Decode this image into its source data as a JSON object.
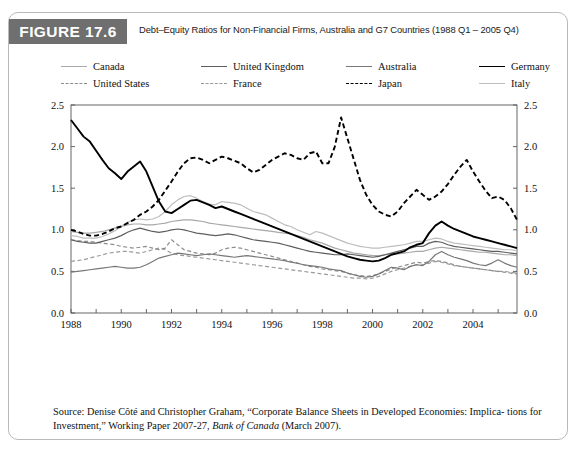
{
  "figure": {
    "badge": "FIGURE 17.6",
    "title": "Debt–Equity Ratios for Non-Financial Firms, Australia and G7 Countries (1988 Q1 – 2005 Q4)"
  },
  "source": {
    "line1_a": "Source: Denise Côté and Christopher Graham, “Corporate Balance Sheets in Developed Economies: Implica-",
    "line2_a": "tions for Investment,” Working Paper 2007-27, ",
    "line2_ital": "Bank of Canada",
    "line2_b": " (March 2007)."
  },
  "colors": {
    "canada": "#a8a8a8",
    "united_states": "#8d8d8d",
    "united_kingdom": "#5e5e5e",
    "france": "#9a9a9a",
    "australia": "#777777",
    "japan": "#000000",
    "germany": "#000000",
    "italy": "#bdbdbd",
    "axis": "#555555",
    "badge_bg": "#6f6f6f"
  },
  "chart_data": {
    "type": "line",
    "title": "Debt–Equity Ratios for Non-Financial Firms, Australia and G7 Countries (1988 Q1 – 2005 Q4)",
    "xlabel": "",
    "ylabel": "",
    "xlim": [
      1988,
      2005.75
    ],
    "ylim": [
      0.0,
      2.5
    ],
    "grid": false,
    "legend_position": "top",
    "y_ticks": [
      "0.0",
      "0.5",
      "1.0",
      "1.5",
      "2.0",
      "2.5"
    ],
    "y_tick_values": [
      0.0,
      0.5,
      1.0,
      1.5,
      2.0,
      2.5
    ],
    "y_axis_right_ticks": [
      "0.0",
      "0.5",
      "1.0",
      "1.5",
      "2.0",
      "2.5"
    ],
    "x_ticks": [
      "1988",
      "1990",
      "1992",
      "1994",
      "1996",
      "1998",
      "2000",
      "2002",
      "2004"
    ],
    "x_tick_values": [
      1988,
      1990,
      1992,
      1994,
      1996,
      1998,
      2000,
      2002,
      2004
    ],
    "x": [
      1988.0,
      1988.25,
      1988.5,
      1988.75,
      1989.0,
      1989.25,
      1989.5,
      1989.75,
      1990.0,
      1990.25,
      1990.5,
      1990.75,
      1991.0,
      1991.25,
      1991.5,
      1991.75,
      1992.0,
      1992.25,
      1992.5,
      1992.75,
      1993.0,
      1993.25,
      1993.5,
      1993.75,
      1994.0,
      1994.25,
      1994.5,
      1994.75,
      1995.0,
      1995.25,
      1995.5,
      1995.75,
      1996.0,
      1996.25,
      1996.5,
      1996.75,
      1997.0,
      1997.25,
      1997.5,
      1997.75,
      1998.0,
      1998.25,
      1998.5,
      1998.75,
      1999.0,
      1999.25,
      1999.5,
      1999.75,
      2000.0,
      2000.25,
      2000.5,
      2000.75,
      2001.0,
      2001.25,
      2001.5,
      2001.75,
      2002.0,
      2002.25,
      2002.5,
      2002.75,
      2003.0,
      2003.25,
      2003.5,
      2003.75,
      2004.0,
      2004.25,
      2004.5,
      2004.75,
      2005.0,
      2005.25,
      2005.5,
      2005.75
    ],
    "series": [
      {
        "name": "Germany",
        "style": "solid",
        "width": 1.9,
        "color": "#000000",
        "values": [
          2.32,
          2.22,
          2.12,
          2.06,
          1.95,
          1.84,
          1.74,
          1.68,
          1.61,
          1.7,
          1.76,
          1.82,
          1.7,
          1.52,
          1.34,
          1.22,
          1.2,
          1.25,
          1.3,
          1.35,
          1.36,
          1.33,
          1.3,
          1.26,
          1.28,
          1.25,
          1.22,
          1.19,
          1.16,
          1.13,
          1.1,
          1.07,
          1.04,
          1.01,
          0.98,
          0.95,
          0.92,
          0.89,
          0.86,
          0.83,
          0.8,
          0.77,
          0.74,
          0.71,
          0.68,
          0.66,
          0.64,
          0.63,
          0.62,
          0.63,
          0.66,
          0.7,
          0.72,
          0.74,
          0.79,
          0.82,
          0.84,
          0.96,
          1.05,
          1.1,
          1.05,
          1.01,
          0.98,
          0.95,
          0.92,
          0.9,
          0.88,
          0.86,
          0.84,
          0.82,
          0.8,
          0.78
        ]
      },
      {
        "name": "Japan",
        "style": "dashed",
        "width": 1.9,
        "color": "#000000",
        "values": [
          1.0,
          0.98,
          0.95,
          0.93,
          0.93,
          0.95,
          0.98,
          1.02,
          1.04,
          1.08,
          1.12,
          1.18,
          1.22,
          1.28,
          1.36,
          1.47,
          1.58,
          1.7,
          1.8,
          1.86,
          1.87,
          1.84,
          1.8,
          1.84,
          1.88,
          1.86,
          1.83,
          1.8,
          1.74,
          1.69,
          1.72,
          1.78,
          1.84,
          1.88,
          1.92,
          1.9,
          1.86,
          1.84,
          1.92,
          1.94,
          1.8,
          1.8,
          2.0,
          2.35,
          2.1,
          1.85,
          1.6,
          1.42,
          1.3,
          1.22,
          1.18,
          1.16,
          1.22,
          1.32,
          1.4,
          1.48,
          1.42,
          1.36,
          1.4,
          1.46,
          1.55,
          1.66,
          1.76,
          1.84,
          1.7,
          1.58,
          1.47,
          1.38,
          1.4,
          1.36,
          1.26,
          1.12
        ]
      },
      {
        "name": "Italy",
        "style": "solid",
        "width": 1.2,
        "color": "#bdbdbd",
        "values": [
          0.93,
          0.92,
          0.9,
          0.9,
          0.9,
          0.92,
          0.95,
          0.99,
          1.04,
          1.09,
          1.12,
          1.13,
          1.12,
          1.13,
          1.16,
          1.22,
          1.3,
          1.36,
          1.4,
          1.41,
          1.38,
          1.34,
          1.31,
          1.3,
          1.34,
          1.33,
          1.32,
          1.3,
          1.26,
          1.22,
          1.2,
          1.18,
          1.14,
          1.1,
          1.06,
          1.04,
          1.0,
          0.97,
          0.94,
          0.98,
          0.96,
          0.93,
          0.9,
          0.87,
          0.84,
          0.82,
          0.8,
          0.79,
          0.78,
          0.78,
          0.79,
          0.8,
          0.81,
          0.82,
          0.84,
          0.86,
          0.86,
          0.88,
          0.9,
          0.89,
          0.86,
          0.84,
          0.83,
          0.82,
          0.81,
          0.8,
          0.79,
          0.78,
          0.77,
          0.76,
          0.76,
          0.75
        ]
      },
      {
        "name": "Canada",
        "style": "solid",
        "width": 1.2,
        "color": "#a8a8a8",
        "values": [
          0.98,
          0.97,
          0.96,
          0.96,
          0.97,
          0.98,
          1.0,
          1.02,
          1.04,
          1.06,
          1.07,
          1.07,
          1.06,
          1.06,
          1.07,
          1.08,
          1.1,
          1.11,
          1.12,
          1.12,
          1.11,
          1.1,
          1.08,
          1.07,
          1.06,
          1.05,
          1.04,
          1.03,
          1.02,
          1.01,
          1.0,
          0.99,
          0.98,
          0.97,
          0.96,
          0.95,
          0.93,
          0.91,
          0.88,
          0.86,
          0.84,
          0.81,
          0.78,
          0.76,
          0.74,
          0.72,
          0.71,
          0.7,
          0.69,
          0.69,
          0.7,
          0.71,
          0.71,
          0.72,
          0.73,
          0.74,
          0.74,
          0.76,
          0.78,
          0.79,
          0.78,
          0.77,
          0.76,
          0.75,
          0.74,
          0.73,
          0.73,
          0.72,
          0.71,
          0.7,
          0.7,
          0.69
        ]
      },
      {
        "name": "United Kingdom",
        "style": "solid",
        "width": 1.2,
        "color": "#5e5e5e",
        "values": [
          0.88,
          0.86,
          0.85,
          0.84,
          0.84,
          0.86,
          0.88,
          0.9,
          0.93,
          0.97,
          1.0,
          1.02,
          1.0,
          0.98,
          0.97,
          0.98,
          1.0,
          1.01,
          1.0,
          0.98,
          0.96,
          0.95,
          0.94,
          0.93,
          0.94,
          0.95,
          0.94,
          0.92,
          0.9,
          0.88,
          0.87,
          0.86,
          0.85,
          0.84,
          0.82,
          0.8,
          0.78,
          0.76,
          0.74,
          0.73,
          0.72,
          0.71,
          0.7,
          0.7,
          0.71,
          0.7,
          0.69,
          0.68,
          0.67,
          0.68,
          0.7,
          0.72,
          0.74,
          0.76,
          0.78,
          0.8,
          0.8,
          0.84,
          0.86,
          0.85,
          0.82,
          0.8,
          0.79,
          0.78,
          0.77,
          0.76,
          0.75,
          0.74,
          0.74,
          0.73,
          0.72,
          0.71
        ]
      },
      {
        "name": "Australia",
        "style": "solid",
        "width": 1.2,
        "color": "#777777",
        "values": [
          0.49,
          0.5,
          0.51,
          0.52,
          0.53,
          0.54,
          0.55,
          0.56,
          0.55,
          0.54,
          0.54,
          0.55,
          0.58,
          0.62,
          0.66,
          0.68,
          0.7,
          0.72,
          0.71,
          0.7,
          0.69,
          0.7,
          0.71,
          0.7,
          0.69,
          0.68,
          0.67,
          0.68,
          0.69,
          0.68,
          0.67,
          0.66,
          0.65,
          0.64,
          0.63,
          0.61,
          0.6,
          0.58,
          0.57,
          0.56,
          0.55,
          0.53,
          0.52,
          0.51,
          0.48,
          0.46,
          0.44,
          0.43,
          0.44,
          0.47,
          0.51,
          0.55,
          0.54,
          0.52,
          0.56,
          0.58,
          0.57,
          0.62,
          0.7,
          0.74,
          0.7,
          0.67,
          0.65,
          0.63,
          0.6,
          0.58,
          0.57,
          0.6,
          0.64,
          0.6,
          0.57,
          0.55
        ]
      },
      {
        "name": "United States",
        "style": "dashed",
        "width": 1.2,
        "color": "#8d8d8d",
        "values": [
          0.88,
          0.87,
          0.86,
          0.86,
          0.85,
          0.84,
          0.83,
          0.82,
          0.8,
          0.79,
          0.78,
          0.79,
          0.8,
          0.78,
          0.76,
          0.78,
          0.88,
          0.82,
          0.76,
          0.74,
          0.72,
          0.71,
          0.7,
          0.72,
          0.76,
          0.78,
          0.79,
          0.78,
          0.76,
          0.74,
          0.72,
          0.7,
          0.68,
          0.66,
          0.64,
          0.62,
          0.6,
          0.58,
          0.56,
          0.55,
          0.53,
          0.52,
          0.51,
          0.5,
          0.48,
          0.46,
          0.45,
          0.44,
          0.45,
          0.47,
          0.5,
          0.53,
          0.55,
          0.57,
          0.59,
          0.61,
          0.6,
          0.62,
          0.63,
          0.62,
          0.6,
          0.58,
          0.56,
          0.55,
          0.54,
          0.53,
          0.52,
          0.51,
          0.5,
          0.49,
          0.48,
          0.47
        ]
      },
      {
        "name": "France",
        "style": "dashed",
        "width": 1.2,
        "color": "#9a9a9a",
        "values": [
          0.62,
          0.63,
          0.64,
          0.66,
          0.68,
          0.7,
          0.72,
          0.73,
          0.74,
          0.74,
          0.73,
          0.72,
          0.74,
          0.76,
          0.78,
          0.76,
          0.72,
          0.7,
          0.69,
          0.68,
          0.67,
          0.66,
          0.65,
          0.64,
          0.63,
          0.62,
          0.61,
          0.6,
          0.59,
          0.58,
          0.57,
          0.56,
          0.55,
          0.54,
          0.53,
          0.52,
          0.51,
          0.5,
          0.49,
          0.48,
          0.47,
          0.46,
          0.45,
          0.44,
          0.43,
          0.42,
          0.42,
          0.41,
          0.42,
          0.44,
          0.47,
          0.5,
          0.52,
          0.54,
          0.56,
          0.58,
          0.58,
          0.6,
          0.62,
          0.61,
          0.59,
          0.57,
          0.56,
          0.55,
          0.54,
          0.53,
          0.52,
          0.51,
          0.5,
          0.5,
          0.49,
          0.48
        ]
      }
    ]
  },
  "legend": {
    "items": [
      {
        "label": "Canada",
        "style": "solid",
        "color": "#a8a8a8",
        "width": 1.3,
        "col": 0,
        "row": 0
      },
      {
        "label": "United States",
        "style": "dashed",
        "color": "#8d8d8d",
        "width": 1.3,
        "col": 0,
        "row": 1
      },
      {
        "label": "United Kingdom",
        "style": "solid",
        "color": "#5e5e5e",
        "width": 1.3,
        "col": 1,
        "row": 0
      },
      {
        "label": "France",
        "style": "dashed",
        "color": "#9a9a9a",
        "width": 1.3,
        "col": 1,
        "row": 1
      },
      {
        "label": "Australia",
        "style": "solid",
        "color": "#777777",
        "width": 1.3,
        "col": 2,
        "row": 0
      },
      {
        "label": "Japan",
        "style": "dashed",
        "color": "#000000",
        "width": 1.8,
        "col": 2,
        "row": 1
      },
      {
        "label": "Germany",
        "style": "solid",
        "color": "#000000",
        "width": 1.9,
        "col": 3,
        "row": 0
      },
      {
        "label": "Italy",
        "style": "solid",
        "color": "#bdbdbd",
        "width": 1.3,
        "col": 3,
        "row": 1
      }
    ]
  }
}
